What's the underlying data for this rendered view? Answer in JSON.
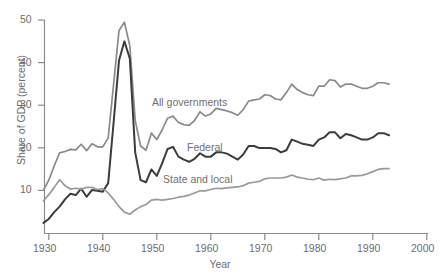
{
  "chart_data": {
    "type": "line",
    "title": "",
    "xlabel": "Year",
    "ylabel": "Share of GDP (percent)",
    "xlim": [
      1928,
      2000
    ],
    "ylim": [
      0,
      50
    ],
    "xticks": [
      1930,
      1940,
      1950,
      1960,
      1970,
      1980,
      1990,
      2000
    ],
    "xticklabels": [
      "1930",
      "1940",
      "1950",
      "1960",
      "1970",
      "1980",
      "1990",
      "2000"
    ],
    "yticks": [
      10,
      20,
      30,
      40,
      50
    ],
    "yticklabels": [
      "10",
      "20",
      "30",
      "40",
      "50"
    ],
    "grid": false,
    "legend_position": "inline-annotations",
    "annotations": [
      {
        "text": "All governments",
        "x": 1950,
        "y": 31.5
      },
      {
        "text": "Federal",
        "x": 1954,
        "y": 21.5
      },
      {
        "text": "State and local",
        "x": 1951,
        "y": 13.0
      }
    ],
    "series": [
      {
        "name": "All governments",
        "color": "#8a8a8a",
        "x": [
          1929,
          1930,
          1931,
          1932,
          1933,
          1934,
          1935,
          1936,
          1937,
          1938,
          1939,
          1940,
          1941,
          1942,
          1943,
          1944,
          1945,
          1946,
          1947,
          1948,
          1949,
          1950,
          1951,
          1952,
          1953,
          1954,
          1955,
          1956,
          1957,
          1958,
          1959,
          1960,
          1961,
          1962,
          1963,
          1964,
          1965,
          1966,
          1967,
          1968,
          1969,
          1970,
          1971,
          1972,
          1973,
          1974,
          1975,
          1976,
          1977,
          1978,
          1979,
          1980,
          1981,
          1982,
          1983,
          1984,
          1985,
          1986,
          1987,
          1988,
          1989,
          1990,
          1991,
          1992,
          1993
        ],
        "y": [
          10.1,
          12.5,
          15.8,
          18.9,
          19.2,
          19.7,
          19.6,
          20.9,
          19.4,
          21.0,
          20.3,
          20.3,
          22.4,
          35.0,
          47.5,
          49.5,
          44.0,
          26.5,
          20.5,
          19.5,
          23.5,
          22.0,
          24.3,
          27.0,
          27.5,
          26.0,
          25.5,
          25.3,
          26.5,
          28.5,
          27.5,
          28.0,
          29.3,
          29.0,
          28.7,
          28.3,
          27.7,
          29.0,
          31.0,
          31.3,
          31.5,
          32.5,
          32.3,
          31.5,
          31.3,
          33.0,
          35.0,
          33.7,
          33.0,
          32.5,
          32.3,
          34.5,
          34.5,
          36.0,
          35.8,
          34.3,
          35.0,
          35.0,
          34.5,
          34.0,
          34.0,
          34.5,
          35.3,
          35.3,
          35.0
        ]
      },
      {
        "name": "Federal",
        "color": "#3c3c3c",
        "x": [
          1929,
          1930,
          1931,
          1932,
          1933,
          1934,
          1935,
          1936,
          1937,
          1938,
          1939,
          1940,
          1941,
          1942,
          1943,
          1944,
          1945,
          1946,
          1947,
          1948,
          1949,
          1950,
          1951,
          1952,
          1953,
          1954,
          1955,
          1956,
          1957,
          1958,
          1959,
          1960,
          1961,
          1962,
          1963,
          1964,
          1965,
          1966,
          1967,
          1968,
          1969,
          1970,
          1971,
          1972,
          1973,
          1974,
          1975,
          1976,
          1977,
          1978,
          1979,
          1980,
          1981,
          1982,
          1983,
          1984,
          1985,
          1986,
          1987,
          1988,
          1989,
          1990,
          1991,
          1992,
          1993
        ],
        "y": [
          2.5,
          3.4,
          5.0,
          6.3,
          8.0,
          9.3,
          9.0,
          10.5,
          8.6,
          10.2,
          10.0,
          9.8,
          11.8,
          26.0,
          40.5,
          45.0,
          41.0,
          19.0,
          12.5,
          12.0,
          15.0,
          13.5,
          16.5,
          19.8,
          20.3,
          18.0,
          17.3,
          16.8,
          17.5,
          18.8,
          18.0,
          18.0,
          19.0,
          19.0,
          18.7,
          18.0,
          17.3,
          18.5,
          20.5,
          20.5,
          20.0,
          20.0,
          20.0,
          19.8,
          19.0,
          19.5,
          22.0,
          21.5,
          21.0,
          20.8,
          20.5,
          22.0,
          22.5,
          23.7,
          23.7,
          22.3,
          23.3,
          23.0,
          22.5,
          22.0,
          22.0,
          22.5,
          23.5,
          23.5,
          23.0
        ]
      },
      {
        "name": "State and local",
        "color": "#9a9a9a",
        "x": [
          1929,
          1930,
          1931,
          1932,
          1933,
          1934,
          1935,
          1936,
          1937,
          1938,
          1939,
          1940,
          1941,
          1942,
          1943,
          1944,
          1945,
          1946,
          1947,
          1948,
          1949,
          1950,
          1951,
          1952,
          1953,
          1954,
          1955,
          1956,
          1957,
          1958,
          1959,
          1960,
          1961,
          1962,
          1963,
          1964,
          1965,
          1966,
          1967,
          1968,
          1969,
          1970,
          1971,
          1972,
          1973,
          1974,
          1975,
          1976,
          1977,
          1978,
          1979,
          1980,
          1981,
          1982,
          1983,
          1984,
          1985,
          1986,
          1987,
          1988,
          1989,
          1990,
          1991,
          1992,
          1993
        ],
        "y": [
          7.6,
          9.1,
          10.8,
          12.6,
          11.2,
          10.4,
          10.6,
          10.4,
          10.8,
          10.8,
          10.3,
          10.5,
          9.5,
          8.0,
          6.3,
          5.0,
          4.5,
          5.5,
          6.3,
          6.8,
          7.8,
          8.0,
          7.8,
          8.0,
          8.2,
          8.5,
          8.7,
          9.0,
          9.5,
          10.0,
          10.0,
          10.3,
          10.6,
          10.5,
          10.7,
          10.8,
          10.9,
          11.2,
          11.8,
          12.0,
          12.2,
          12.8,
          13.0,
          13.0,
          13.0,
          13.2,
          13.7,
          13.2,
          13.0,
          12.7,
          12.6,
          13.0,
          12.5,
          12.7,
          12.6,
          12.8,
          13.0,
          13.5,
          13.5,
          13.6,
          14.0,
          14.5,
          15.0,
          15.2,
          15.2
        ]
      }
    ]
  },
  "figure": {
    "caption_partial": ""
  }
}
